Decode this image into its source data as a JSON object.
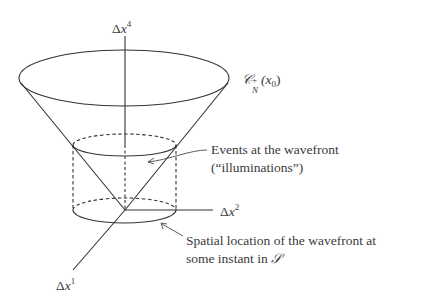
{
  "diagram": {
    "axes": {
      "vertical": {
        "label_prefix": "Δ",
        "label_var": "x",
        "label_sup": "4"
      },
      "horizontal": {
        "label_prefix": "Δ",
        "label_var": "x",
        "label_sup": "2"
      },
      "oblique": {
        "label_prefix": "Δ",
        "label_var": "x",
        "label_sup": "1"
      }
    },
    "cone_label": {
      "symbol": "𝒞",
      "sub": "N",
      "sup": "+",
      "arg": "(x",
      "arg_sub": "0",
      "arg_close": ")"
    },
    "annotations": {
      "events": {
        "line1": "Events at the wavefront",
        "line2": "(“illuminations”)"
      },
      "spatial": {
        "line1": "Spatial location of the wavefront at",
        "line2_text": "some instant in ",
        "line2_symbol": "𝒮"
      }
    },
    "colors": {
      "stroke": "#333333",
      "background": "#ffffff"
    }
  }
}
